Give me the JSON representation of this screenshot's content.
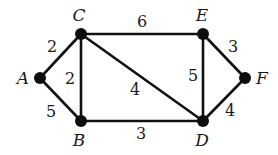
{
  "diagram": {
    "type": "weighted-undirected-graph",
    "nodes": [
      {
        "id": "A",
        "label": "A",
        "x": 40,
        "y": 78,
        "lx": 23,
        "ly": 84
      },
      {
        "id": "B",
        "label": "B",
        "x": 81,
        "y": 121,
        "lx": 79,
        "ly": 146
      },
      {
        "id": "C",
        "label": "C",
        "x": 81,
        "y": 34,
        "lx": 79,
        "ly": 21
      },
      {
        "id": "D",
        "label": "D",
        "x": 203,
        "y": 121,
        "lx": 202,
        "ly": 146
      },
      {
        "id": "E",
        "label": "E",
        "x": 203,
        "y": 34,
        "lx": 202,
        "ly": 21
      },
      {
        "id": "F",
        "label": "F",
        "x": 245,
        "y": 78,
        "lx": 262,
        "ly": 84
      }
    ],
    "edges": [
      {
        "from": "A",
        "to": "C",
        "weight": "2",
        "lx": 52,
        "ly": 52
      },
      {
        "from": "A",
        "to": "B",
        "weight": "5",
        "lx": 51,
        "ly": 117
      },
      {
        "from": "C",
        "to": "B",
        "weight": "2",
        "lx": 70,
        "ly": 84
      },
      {
        "from": "C",
        "to": "E",
        "weight": "6",
        "lx": 142,
        "ly": 27
      },
      {
        "from": "C",
        "to": "D",
        "weight": "4",
        "lx": 135,
        "ly": 95
      },
      {
        "from": "B",
        "to": "D",
        "weight": "3",
        "lx": 141,
        "ly": 139
      },
      {
        "from": "E",
        "to": "D",
        "weight": "5",
        "lx": 193,
        "ly": 81
      },
      {
        "from": "E",
        "to": "F",
        "weight": "3",
        "lx": 233,
        "ly": 52
      },
      {
        "from": "F",
        "to": "D",
        "weight": "4",
        "lx": 230,
        "ly": 116
      }
    ]
  },
  "colors": {
    "edge": "#111111",
    "node": "#0d0d0d",
    "text": "#1a1a1a",
    "background": "#ffffff"
  }
}
